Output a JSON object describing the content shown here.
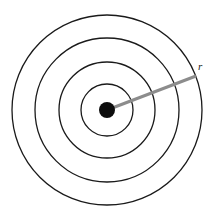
{
  "figure": {
    "name": "concentric-circles-radius-diagram",
    "background_color": "#ffffff",
    "width": 214,
    "height": 216,
    "center": {
      "x": 107,
      "y": 110
    },
    "ring_color": "#1a1a1a",
    "ring_stroke_width": 1.3,
    "rings": [
      {
        "label": "ring-1-innermost",
        "radius": 26
      },
      {
        "label": "ring-2",
        "radius": 48
      },
      {
        "label": "ring-3",
        "radius": 72
      },
      {
        "label": "ring-4-outermost",
        "radius": 95
      }
    ],
    "center_dot": {
      "label": "center-dot",
      "radius": 8,
      "color": "#0d0d0d"
    },
    "radius_line": {
      "label": "radius-line",
      "color": "#8c8c8c",
      "stroke_width": 3,
      "from": {
        "x": 107,
        "y": 110
      },
      "to": {
        "x": 196,
        "y": 76
      }
    },
    "radius_label": {
      "text": "r",
      "x": 198,
      "y": 70
    }
  }
}
